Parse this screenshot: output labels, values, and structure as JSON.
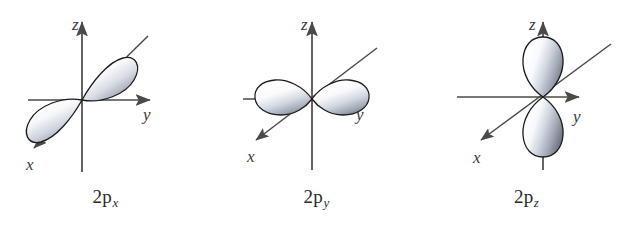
{
  "figure": {
    "background_color": "#ffffff",
    "panel_count": 3
  },
  "style": {
    "axis_color": "#4a4a46",
    "lobe_outline_color": "#1c1c1c",
    "lobe_light_color": "#ffffff",
    "lobe_mid_color": "#c3c8d2",
    "lobe_dark_color": "#7d8592",
    "label_color": "#3a3a3a",
    "caption_color": "#2a2a2a"
  },
  "axes": {
    "z": {
      "label": "z",
      "direction": "up",
      "arrow": true
    },
    "y": {
      "label": "y",
      "direction": "right",
      "arrow": true
    },
    "x": {
      "label": "x",
      "direction": "down-left",
      "arrow": true
    }
  },
  "panels": [
    {
      "id": "2px",
      "caption_prefix": "2p",
      "caption_subscript": "x",
      "orbital": "2p_x",
      "lobe_axis": "x",
      "lobe_orientation": "diagonal",
      "lobe_count": 2,
      "nodal_plane": "yz",
      "axis_labels": {
        "z": "z",
        "y": "y",
        "x": "x"
      }
    },
    {
      "id": "2py",
      "caption_prefix": "2p",
      "caption_subscript": "y",
      "orbital": "2p_y",
      "lobe_axis": "y",
      "lobe_orientation": "horizontal",
      "lobe_count": 2,
      "nodal_plane": "xz",
      "axis_labels": {
        "z": "z",
        "y": "y",
        "x": "x"
      }
    },
    {
      "id": "2pz",
      "caption_prefix": "2p",
      "caption_subscript": "z",
      "orbital": "2p_z",
      "lobe_axis": "z",
      "lobe_orientation": "vertical",
      "lobe_count": 2,
      "nodal_plane": "xy",
      "axis_labels": {
        "z": "z",
        "y": "y",
        "x": "x"
      }
    }
  ]
}
